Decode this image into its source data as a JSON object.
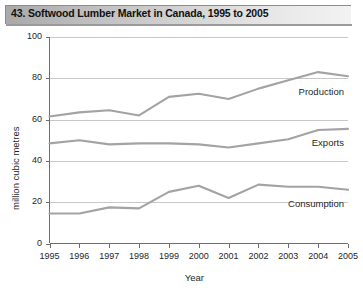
{
  "title": "43. Softwood Lumber Market in Canada, 1995 to 2005",
  "axis": {
    "ylabel": "million cubic metres",
    "xlabel": "Year",
    "yticks": [
      "0",
      "20",
      "40",
      "60",
      "80",
      "100"
    ],
    "xticks": [
      "1995",
      "1996",
      "1997",
      "1998",
      "1999",
      "2000",
      "2001",
      "2002",
      "2003",
      "2004",
      "2005"
    ]
  },
  "labels": {
    "production": "Production",
    "exports": "Exports",
    "consumption": "Consumption"
  },
  "colors": {
    "line": "#a3a3a3",
    "grid": "#c8c8c8",
    "axis": "#6e6e6e",
    "title_bar_dark": "#a9a9a9",
    "title_bar_light": "#f2f2f2",
    "background": "#ffffff"
  },
  "chart_data": {
    "type": "line",
    "title": "43. Softwood Lumber Market in Canada, 1995 to 2005",
    "xlabel": "Year",
    "ylabel": "million cubic metres",
    "categories": [
      1995,
      1996,
      1997,
      1998,
      1999,
      2000,
      2001,
      2002,
      2003,
      2004,
      2005
    ],
    "ylim": [
      0,
      100
    ],
    "yticks": [
      0,
      20,
      40,
      60,
      80,
      100
    ],
    "grid": "horizontal",
    "legend": "inline-end-labels",
    "series": [
      {
        "name": "Production",
        "values": [
          61.5,
          63.5,
          64.5,
          62.0,
          71.0,
          72.5,
          70.0,
          75.0,
          79.0,
          83.0,
          81.0
        ]
      },
      {
        "name": "Exports",
        "values": [
          48.5,
          50.0,
          48.0,
          48.5,
          48.5,
          48.0,
          46.5,
          48.5,
          50.5,
          55.0,
          55.5
        ]
      },
      {
        "name": "Consumption",
        "values": [
          14.5,
          14.5,
          17.5,
          17.0,
          25.0,
          28.0,
          22.0,
          28.5,
          27.5,
          27.5,
          26.0
        ]
      }
    ]
  }
}
